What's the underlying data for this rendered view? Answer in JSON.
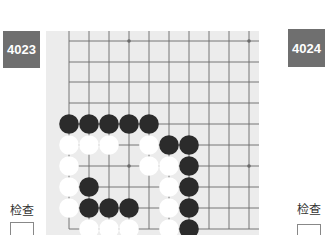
{
  "problems": [
    {
      "number": "4023",
      "check_label": "检查"
    },
    {
      "number": "4024",
      "check_label": "检查"
    }
  ],
  "colors": {
    "badge_bg": "#6f6f6f",
    "board_bg": "#ececec",
    "grid_line": "#6a6a6a",
    "black_stone": "#2b2b2b",
    "white_stone": "#ffffff"
  },
  "board": {
    "columns_x": [
      69,
      89,
      109,
      129,
      149,
      169,
      189,
      209,
      229,
      249
    ],
    "rows_y": [
      41,
      62,
      82,
      103,
      124,
      145,
      166,
      187,
      208,
      229
    ],
    "star_points": [
      [
        129,
        41
      ],
      [
        249,
        41
      ],
      [
        129,
        166
      ],
      [
        249,
        166
      ]
    ],
    "stones": [
      {
        "c": "B",
        "x": 69,
        "y": 124
      },
      {
        "c": "B",
        "x": 89,
        "y": 124
      },
      {
        "c": "B",
        "x": 109,
        "y": 124
      },
      {
        "c": "B",
        "x": 129,
        "y": 124
      },
      {
        "c": "B",
        "x": 149,
        "y": 124
      },
      {
        "c": "W",
        "x": 69,
        "y": 145
      },
      {
        "c": "W",
        "x": 89,
        "y": 145
      },
      {
        "c": "W",
        "x": 109,
        "y": 145
      },
      {
        "c": "W",
        "x": 149,
        "y": 145
      },
      {
        "c": "B",
        "x": 169,
        "y": 145
      },
      {
        "c": "B",
        "x": 189,
        "y": 145
      },
      {
        "c": "W",
        "x": 69,
        "y": 166
      },
      {
        "c": "W",
        "x": 149,
        "y": 166
      },
      {
        "c": "W",
        "x": 169,
        "y": 166
      },
      {
        "c": "B",
        "x": 189,
        "y": 166
      },
      {
        "c": "W",
        "x": 69,
        "y": 187
      },
      {
        "c": "B",
        "x": 89,
        "y": 187
      },
      {
        "c": "W",
        "x": 169,
        "y": 187
      },
      {
        "c": "B",
        "x": 189,
        "y": 187
      },
      {
        "c": "W",
        "x": 69,
        "y": 208
      },
      {
        "c": "B",
        "x": 89,
        "y": 208
      },
      {
        "c": "B",
        "x": 109,
        "y": 208
      },
      {
        "c": "B",
        "x": 129,
        "y": 208
      },
      {
        "c": "W",
        "x": 169,
        "y": 208
      },
      {
        "c": "B",
        "x": 189,
        "y": 208
      },
      {
        "c": "W",
        "x": 89,
        "y": 229
      },
      {
        "c": "W",
        "x": 109,
        "y": 229
      },
      {
        "c": "W",
        "x": 129,
        "y": 229
      },
      {
        "c": "W",
        "x": 169,
        "y": 229
      },
      {
        "c": "B",
        "x": 189,
        "y": 229
      }
    ]
  }
}
